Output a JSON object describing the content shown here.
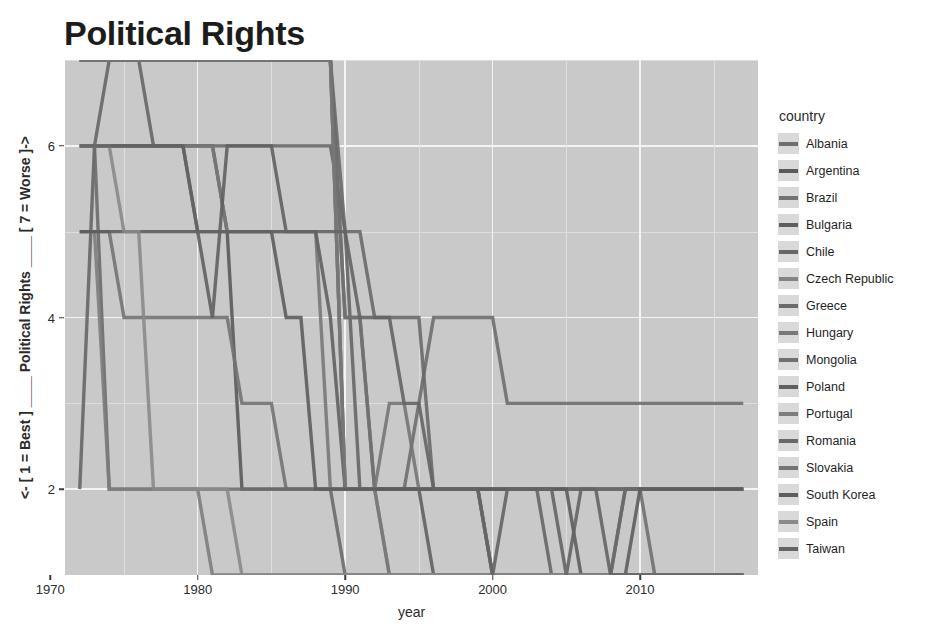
{
  "title": "Political Rights",
  "axes": {
    "x_title": "year",
    "y_title": "<- [ 1 = Best ] ____ Political Rights ____ [ 7 = Worse ]->",
    "x_ticks": [
      "1970",
      "1980",
      "1990",
      "2000",
      "2010"
    ],
    "y_ticks": [
      "2",
      "4",
      "6"
    ]
  },
  "legend": {
    "title": "country",
    "items": [
      {
        "label": "Albania",
        "color": "#6e6e6e"
      },
      {
        "label": "Argentina",
        "color": "#5a5a5a"
      },
      {
        "label": "Brazil",
        "color": "#737373"
      },
      {
        "label": "Bulgaria",
        "color": "#5f5f5f"
      },
      {
        "label": "Chile",
        "color": "#666666"
      },
      {
        "label": "Czech Republic",
        "color": "#848484"
      },
      {
        "label": "Greece",
        "color": "#6b6b6b"
      },
      {
        "label": "Hungary",
        "color": "#787878"
      },
      {
        "label": "Mongolia",
        "color": "#707070"
      },
      {
        "label": "Poland",
        "color": "#606060"
      },
      {
        "label": "Portugal",
        "color": "#7d7d7d"
      },
      {
        "label": "Romania",
        "color": "#696969"
      },
      {
        "label": "Slovakia",
        "color": "#757575"
      },
      {
        "label": "South Korea",
        "color": "#5d5d5d"
      },
      {
        "label": "Spain",
        "color": "#8a8a8a"
      },
      {
        "label": "Taiwan",
        "color": "#646464"
      }
    ]
  },
  "chart_data": {
    "type": "line",
    "title": "Political Rights",
    "xlabel": "year",
    "ylabel": "<- [ 1 = Best ] ____ Political Rights ____ [ 7 = Worse ]->",
    "xlim": [
      1971,
      2018
    ],
    "ylim": [
      1,
      7
    ],
    "x_ticks": [
      1970,
      1980,
      1990,
      2000,
      2010
    ],
    "y_ticks": [
      2,
      4,
      6
    ],
    "grid": true,
    "legend_position": "right",
    "legend_title": "country",
    "x": [
      1972,
      1973,
      1974,
      1975,
      1976,
      1977,
      1978,
      1979,
      1980,
      1981,
      1982,
      1983,
      1984,
      1985,
      1986,
      1987,
      1988,
      1989,
      1990,
      1991,
      1992,
      1993,
      1994,
      1995,
      1996,
      1997,
      1998,
      1999,
      2000,
      2001,
      2002,
      2003,
      2004,
      2005,
      2006,
      2007,
      2008,
      2009,
      2010,
      2011,
      2012,
      2013,
      2014,
      2015,
      2016,
      2017
    ],
    "series": [
      {
        "name": "Albania",
        "color": "#6e6e6e",
        "values": [
          7,
          7,
          7,
          7,
          7,
          7,
          7,
          7,
          7,
          7,
          7,
          7,
          7,
          7,
          7,
          7,
          7,
          7,
          4,
          4,
          2,
          2,
          2,
          3,
          4,
          4,
          4,
          4,
          4,
          3,
          3,
          3,
          3,
          3,
          3,
          3,
          3,
          3,
          3,
          3,
          3,
          3,
          3,
          3,
          3,
          3
        ]
      },
      {
        "name": "Argentina",
        "color": "#5a5a5a",
        "values": [
          6,
          6,
          6,
          6,
          6,
          6,
          6,
          6,
          6,
          6,
          5,
          2,
          2,
          2,
          2,
          2,
          2,
          2,
          2,
          2,
          2,
          2,
          2,
          2,
          2,
          2,
          2,
          2,
          2,
          2,
          2,
          2,
          2,
          2,
          2,
          2,
          2,
          2,
          2,
          2,
          2,
          2,
          2,
          2,
          2,
          2
        ]
      },
      {
        "name": "Brazil",
        "color": "#737373",
        "values": [
          5,
          5,
          5,
          4,
          4,
          4,
          4,
          4,
          4,
          4,
          4,
          3,
          3,
          3,
          2,
          2,
          2,
          2,
          2,
          2,
          2,
          2,
          2,
          2,
          2,
          2,
          2,
          2,
          2,
          2,
          2,
          2,
          2,
          2,
          2,
          2,
          2,
          2,
          2,
          2,
          2,
          2,
          2,
          2,
          2,
          2
        ]
      },
      {
        "name": "Bulgaria",
        "color": "#5f5f5f",
        "values": [
          7,
          7,
          7,
          7,
          7,
          7,
          7,
          7,
          7,
          7,
          7,
          7,
          7,
          7,
          7,
          7,
          7,
          7,
          2,
          2,
          2,
          2,
          2,
          2,
          2,
          2,
          2,
          2,
          1,
          1,
          1,
          1,
          1,
          1,
          1,
          1,
          1,
          2,
          2,
          2,
          2,
          2,
          2,
          2,
          2,
          2
        ]
      },
      {
        "name": "Chile",
        "color": "#666666",
        "values": [
          2,
          6,
          7,
          7,
          7,
          6,
          6,
          6,
          6,
          6,
          6,
          6,
          6,
          6,
          6,
          6,
          6,
          6,
          5,
          2,
          2,
          2,
          2,
          2,
          2,
          2,
          2,
          2,
          2,
          2,
          2,
          2,
          1,
          1,
          1,
          1,
          1,
          1,
          1,
          1,
          1,
          1,
          1,
          1,
          1,
          1
        ]
      },
      {
        "name": "Czech Republic",
        "color": "#848484",
        "values": [
          7,
          7,
          7,
          7,
          7,
          7,
          7,
          7,
          7,
          7,
          7,
          7,
          7,
          7,
          7,
          7,
          7,
          7,
          2,
          2,
          2,
          1,
          1,
          1,
          1,
          1,
          1,
          1,
          1,
          1,
          1,
          1,
          1,
          1,
          1,
          1,
          1,
          1,
          1,
          1,
          1,
          1,
          1,
          1,
          1,
          1
        ]
      },
      {
        "name": "Greece",
        "color": "#6b6b6b",
        "values": [
          6,
          6,
          2,
          2,
          2,
          2,
          2,
          2,
          2,
          2,
          2,
          2,
          2,
          2,
          2,
          2,
          2,
          2,
          1,
          1,
          1,
          1,
          1,
          1,
          1,
          1,
          1,
          1,
          1,
          1,
          1,
          1,
          1,
          1,
          1,
          1,
          1,
          2,
          2,
          2,
          2,
          2,
          2,
          2,
          2,
          2
        ]
      },
      {
        "name": "Hungary",
        "color": "#787878",
        "values": [
          6,
          6,
          6,
          6,
          6,
          6,
          6,
          6,
          6,
          6,
          5,
          5,
          5,
          5,
          5,
          5,
          5,
          2,
          2,
          2,
          2,
          1,
          1,
          1,
          1,
          1,
          1,
          1,
          1,
          1,
          1,
          1,
          1,
          1,
          1,
          1,
          1,
          1,
          1,
          1,
          1,
          1,
          1,
          1,
          1,
          1
        ]
      },
      {
        "name": "Mongolia",
        "color": "#707070",
        "values": [
          7,
          7,
          7,
          7,
          7,
          7,
          7,
          7,
          7,
          7,
          7,
          7,
          7,
          7,
          7,
          7,
          7,
          7,
          4,
          4,
          2,
          2,
          2,
          2,
          2,
          2,
          2,
          2,
          2,
          2,
          2,
          2,
          2,
          2,
          2,
          2,
          2,
          2,
          2,
          1,
          1,
          1,
          1,
          1,
          1,
          1
        ]
      },
      {
        "name": "Poland",
        "color": "#606060",
        "values": [
          6,
          6,
          6,
          6,
          6,
          6,
          6,
          6,
          5,
          4,
          6,
          6,
          6,
          6,
          5,
          5,
          5,
          4,
          2,
          2,
          2,
          2,
          2,
          2,
          1,
          1,
          1,
          1,
          1,
          1,
          1,
          1,
          1,
          1,
          1,
          1,
          1,
          1,
          1,
          1,
          1,
          1,
          1,
          1,
          1,
          1
        ]
      },
      {
        "name": "Portugal",
        "color": "#7d7d7d",
        "values": [
          5,
          5,
          2,
          2,
          2,
          2,
          2,
          2,
          2,
          1,
          1,
          1,
          1,
          1,
          1,
          1,
          1,
          1,
          1,
          1,
          1,
          1,
          1,
          1,
          1,
          1,
          1,
          1,
          1,
          1,
          1,
          1,
          1,
          1,
          1,
          1,
          1,
          1,
          1,
          1,
          1,
          1,
          1,
          1,
          1,
          1
        ]
      },
      {
        "name": "Romania",
        "color": "#696969",
        "values": [
          7,
          7,
          7,
          7,
          7,
          7,
          7,
          7,
          7,
          7,
          7,
          7,
          7,
          7,
          7,
          7,
          7,
          7,
          5,
          5,
          4,
          4,
          4,
          4,
          2,
          2,
          2,
          2,
          2,
          2,
          2,
          2,
          2,
          2,
          2,
          2,
          2,
          2,
          2,
          2,
          2,
          2,
          2,
          2,
          2,
          2
        ]
      },
      {
        "name": "Slovakia",
        "color": "#757575",
        "values": [
          7,
          7,
          7,
          7,
          7,
          7,
          7,
          7,
          7,
          7,
          7,
          7,
          7,
          7,
          7,
          7,
          7,
          7,
          2,
          2,
          2,
          3,
          3,
          2,
          2,
          2,
          2,
          2,
          1,
          1,
          1,
          1,
          1,
          1,
          1,
          1,
          1,
          1,
          1,
          1,
          1,
          1,
          1,
          1,
          1,
          1
        ]
      },
      {
        "name": "South Korea",
        "color": "#5d5d5d",
        "values": [
          5,
          5,
          5,
          5,
          5,
          5,
          5,
          5,
          5,
          5,
          5,
          5,
          5,
          5,
          4,
          4,
          2,
          2,
          2,
          2,
          2,
          2,
          2,
          2,
          2,
          2,
          2,
          2,
          2,
          2,
          2,
          2,
          2,
          2,
          1,
          1,
          1,
          1,
          2,
          2,
          2,
          2,
          2,
          2,
          2,
          2
        ]
      },
      {
        "name": "Spain",
        "color": "#8a8a8a",
        "values": [
          6,
          6,
          6,
          5,
          5,
          2,
          2,
          2,
          2,
          2,
          2,
          1,
          1,
          1,
          1,
          1,
          1,
          1,
          1,
          1,
          1,
          1,
          1,
          1,
          1,
          1,
          1,
          1,
          1,
          1,
          1,
          1,
          1,
          1,
          1,
          1,
          1,
          1,
          1,
          1,
          1,
          1,
          1,
          1,
          1,
          1
        ]
      },
      {
        "name": "Taiwan",
        "color": "#646464",
        "values": [
          6,
          6,
          6,
          6,
          6,
          6,
          6,
          6,
          5,
          5,
          5,
          5,
          5,
          5,
          5,
          5,
          5,
          5,
          5,
          4,
          4,
          4,
          3,
          3,
          2,
          2,
          2,
          2,
          1,
          2,
          2,
          2,
          2,
          1,
          2,
          2,
          1,
          1,
          1,
          1,
          1,
          1,
          1,
          1,
          1,
          1
        ]
      }
    ]
  }
}
